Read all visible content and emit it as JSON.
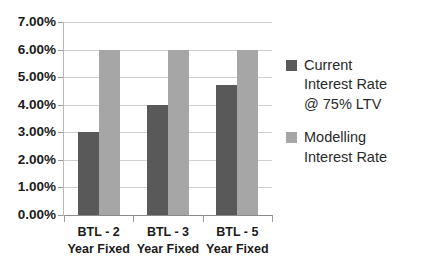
{
  "chart_data": {
    "type": "bar",
    "title": "",
    "subtitle": "",
    "xlabel": "",
    "ylabel": "",
    "categories": [
      "BTL - 2\nYear Fixed",
      "BTL - 3\nYear Fixed",
      "BTL - 5\nYear Fixed"
    ],
    "series": [
      {
        "name": "Current\nInterest Rate\n@ 75% LTV",
        "color": "#595959",
        "values": [
          3.0,
          4.0,
          4.7
        ]
      },
      {
        "name": "Modelling\nInterest Rate",
        "color": "#a6a6a6",
        "values": [
          6.0,
          6.0,
          6.0
        ]
      }
    ],
    "ylim": [
      0,
      7
    ],
    "ytick_values": [
      0,
      1,
      2,
      3,
      4,
      5,
      6,
      7
    ],
    "ytick_labels": [
      "0.00%",
      "1.00%",
      "2.00%",
      "3.00%",
      "4.00%",
      "5.00%",
      "6.00%",
      "7.00%"
    ],
    "grid": "horizontal",
    "legend_position": "right",
    "value_format": "percent"
  },
  "legend": {
    "entries": [
      {
        "label": "Current\nInterest Rate\n@ 75% LTV",
        "color": "#595959"
      },
      {
        "label": "Modelling\nInterest Rate",
        "color": "#a6a6a6"
      }
    ]
  },
  "colors": {
    "series_current": "#595959",
    "series_modelling": "#a6a6a6",
    "gridline": "#d0d0d0",
    "axis": "#8a8a8a",
    "text": "#1b1b1b",
    "background": "#ffffff"
  }
}
